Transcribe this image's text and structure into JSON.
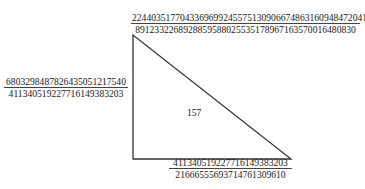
{
  "diagram": {
    "type": "right-triangle",
    "stroke_color": "#333333",
    "vertices": {
      "top": [
        133,
        35
      ],
      "bottom_left": [
        133,
        159
      ],
      "bottom_right": [
        291,
        159
      ]
    },
    "hypotenuse_label": {
      "numerator": "2244035177043369699245575130906674863160948472041",
      "denominator": "8912332268928859588025535178967163570016480830"
    },
    "vertical_side_label": {
      "numerator": "6803298487826435051217540",
      "denominator": "411340519227716149383203"
    },
    "horizontal_side_label": {
      "numerator": "411340519227716149383203",
      "denominator": "21666555693714761309610"
    },
    "area_label": "157"
  }
}
